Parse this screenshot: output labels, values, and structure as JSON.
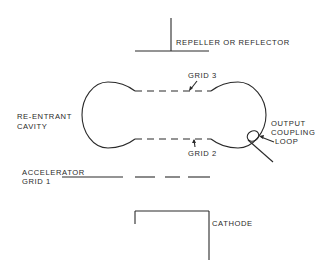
{
  "diagram": {
    "type": "reflex klystron cross-section",
    "labels": {
      "repeller": "REPELLER OR REFLECTOR",
      "grid3": "GRID 3",
      "cavity_line1": "RE-ENTRANT",
      "cavity_line2": "CAVITY",
      "output_line1": "OUTPUT",
      "output_line2": "COUPLING",
      "output_line3": "LOOP",
      "grid2": "GRID 2",
      "accel_line1": "ACCELERATOR",
      "accel_line2": "GRID 1",
      "cathode": "CATHODE"
    },
    "colors": {
      "ink": "#2a2a2a",
      "background": "#ffffff"
    }
  }
}
